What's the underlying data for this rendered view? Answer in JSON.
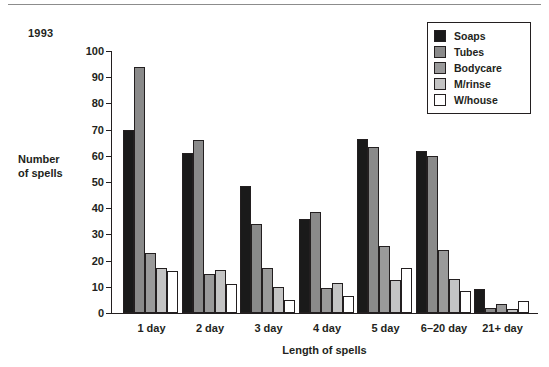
{
  "figure": {
    "year_caption": "1993"
  },
  "legend": {
    "items": [
      {
        "label": "Soaps",
        "color": "#1a1a1a",
        "swatch_name": "legend-swatch-soaps"
      },
      {
        "label": "Tubes",
        "color": "#8a8a8a",
        "swatch_name": "legend-swatch-tubes"
      },
      {
        "label": "Bodycare",
        "color": "#9a9a9a",
        "swatch_name": "legend-swatch-bodycare"
      },
      {
        "label": "M/rinse",
        "color": "#c4c4c4",
        "swatch_name": "legend-swatch-mrinse"
      },
      {
        "label": "W/house",
        "color": "#ffffff",
        "swatch_name": "legend-swatch-whouse"
      }
    ]
  },
  "chart_data": {
    "type": "bar",
    "title": "1993",
    "xlabel": "Length of spells",
    "ylabel": "Number of spells",
    "ylabel_lines": [
      "Number",
      "of spells"
    ],
    "ylim": [
      0,
      100
    ],
    "ytick_step": 10,
    "yticks": [
      0,
      10,
      20,
      30,
      40,
      50,
      60,
      70,
      80,
      90,
      100
    ],
    "ytick_labels": [
      "0",
      "10",
      "20",
      "30",
      "40",
      "50",
      "60",
      "70",
      "80",
      "90",
      "100"
    ],
    "grid": false,
    "legend_position": "top-right",
    "categories": [
      "1 day",
      "2 day",
      "3 day",
      "4 day",
      "5 day",
      "6–20 day",
      "21+ day"
    ],
    "series": [
      {
        "name": "Soaps",
        "color": "#1a1a1a",
        "values": [
          70,
          61,
          48.5,
          36,
          66.5,
          62,
          9
        ]
      },
      {
        "name": "Tubes",
        "color": "#8a8a8a",
        "values": [
          94,
          66,
          34,
          38.5,
          63.5,
          60,
          2
        ]
      },
      {
        "name": "Bodycare",
        "color": "#9a9a9a",
        "values": [
          23,
          15,
          17,
          9.5,
          25.5,
          24,
          3.5
        ]
      },
      {
        "name": "M/rinse",
        "color": "#c4c4c4",
        "values": [
          17,
          16.5,
          10,
          11.5,
          12.5,
          13,
          1.5
        ]
      },
      {
        "name": "W/house",
        "color": "#ffffff",
        "values": [
          16,
          11,
          5,
          6.5,
          17,
          8.5,
          4.5
        ]
      }
    ]
  }
}
